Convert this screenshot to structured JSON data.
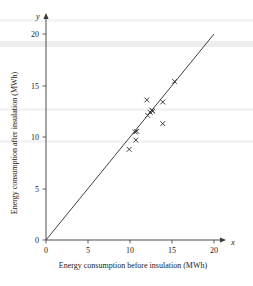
{
  "chart_data": {
    "type": "scatter",
    "title": "",
    "xlabel": "Energy consumption before insulation (MWh)",
    "ylabel": "Energy consumption after insulation (MWh)",
    "x_axis_letter": "x",
    "y_axis_letter": "y",
    "xlim": [
      0,
      20
    ],
    "ylim": [
      0,
      20
    ],
    "xticks": [
      0,
      5,
      10,
      15,
      20
    ],
    "yticks": [
      0,
      5,
      10,
      15,
      20
    ],
    "xtick_labels": [
      "0",
      "5",
      "10",
      "15",
      "20"
    ],
    "ytick_labels": [
      "0",
      "5",
      "10",
      "15",
      "20"
    ],
    "grid": false,
    "legend": false,
    "marker": "x",
    "marker_color": "#2b2b2b",
    "line_color": "#2b2b2b",
    "series": [
      {
        "name": "Households",
        "points": [
          {
            "x": 9.9,
            "y": 8.8
          },
          {
            "x": 10.7,
            "y": 9.7
          },
          {
            "x": 10.6,
            "y": 10.5
          },
          {
            "x": 10.8,
            "y": 10.55
          },
          {
            "x": 12.1,
            "y": 12.1
          },
          {
            "x": 12.4,
            "y": 12.4
          },
          {
            "x": 12.6,
            "y": 12.6
          },
          {
            "x": 12.7,
            "y": 12.5
          },
          {
            "x": 12.0,
            "y": 13.6
          },
          {
            "x": 13.9,
            "y": 11.3
          },
          {
            "x": 13.9,
            "y": 13.4
          },
          {
            "x": 15.3,
            "y": 15.4
          }
        ]
      }
    ],
    "reference_line": {
      "name": "y = x",
      "x_start": 0,
      "y_start": 0,
      "x_end": 20,
      "y_end": 20
    }
  }
}
